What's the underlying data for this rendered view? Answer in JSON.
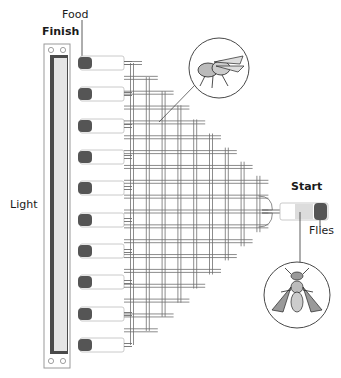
{
  "labels": {
    "food": "Food",
    "finish": "Finish",
    "light": "Light",
    "start": "Start",
    "flies": "Flies"
  },
  "colors": {
    "frame": "#9a9a9a",
    "light_edge": "#4a4a4a",
    "light_fill": "#e4e4e4",
    "food": "#555555",
    "tube_outline": "#bdbdbd",
    "maze_outline": "#6e6e6e",
    "text": "#1a1a1a"
  },
  "diagram": {
    "food_tube_count": 10,
    "food_tube_y": [
      63,
      94,
      126,
      157,
      188,
      220,
      251,
      282,
      314,
      345
    ],
    "maze_columns": 9,
    "maze_column_rows": [
      10,
      9,
      8,
      7,
      6,
      5,
      4,
      3,
      2
    ],
    "icons": [
      "fly-side-view-icon",
      "fly-top-view-icon"
    ]
  }
}
